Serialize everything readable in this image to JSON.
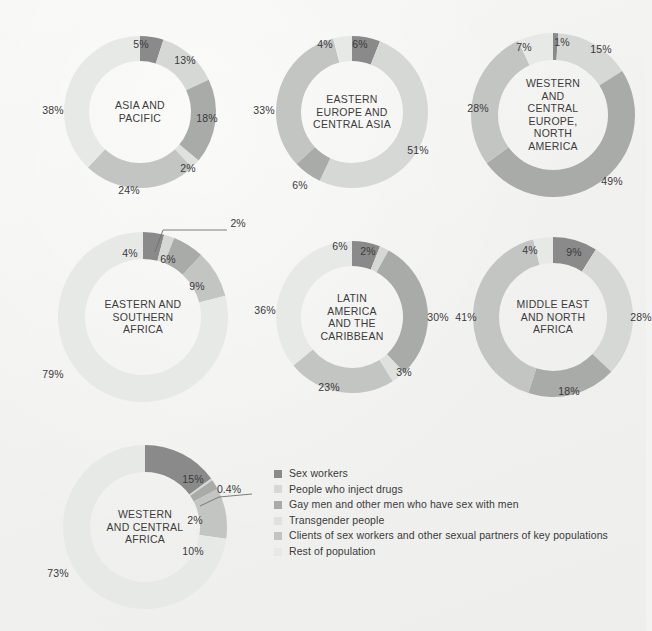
{
  "figure": {
    "background_color": "#f3f3f1",
    "label_color": "#3a3a3a"
  },
  "palette": {
    "sex_workers": "#8a8a8a",
    "people_who_inject_drugs": "#d6d8d6",
    "gay_men": "#a9aba9",
    "transgender_people": "#dfe1df",
    "clients_and_partners": "#c3c5c3",
    "rest_of_population": "#e7e9e7"
  },
  "legend": {
    "position": "bottom-right",
    "items": [
      {
        "label": "Sex workers",
        "color": "#8a8a8a"
      },
      {
        "label": "People who inject drugs",
        "color": "#d6d8d6"
      },
      {
        "label": "Gay men and other men who have sex with men",
        "color": "#a9aba9"
      },
      {
        "label": "Transgender people",
        "color": "#dfe1df"
      },
      {
        "label": "Clients of sex workers and other sexual partners of key populations",
        "color": "#c3c5c3"
      },
      {
        "label": "Rest of population",
        "color": "#e7e9e7"
      }
    ]
  },
  "chart_data": {
    "type": "pie",
    "title": "",
    "subtype": "donut-small-multiples",
    "grid": false,
    "legend_position": "bottom-right",
    "categories": [
      "Sex workers",
      "People who inject drugs",
      "Gay men and other men who have sex with men",
      "Transgender people",
      "Clients of sex workers and other sexual partners of key populations",
      "Rest of population"
    ],
    "category_colors": [
      "#8a8a8a",
      "#d6d8d6",
      "#a9aba9",
      "#dfe1df",
      "#c3c5c3",
      "#e7e9e7"
    ],
    "start_angle_deg": 0,
    "direction": "clockwise",
    "charts": [
      {
        "id": "asia-and-pacific",
        "title_lines": [
          "ASIA AND",
          "PACIFIC"
        ],
        "values": [
          5,
          13,
          18,
          2,
          24,
          38
        ],
        "labels": [
          "5%",
          "13%",
          "18%",
          "2%",
          "24%",
          "38%"
        ],
        "callouts": []
      },
      {
        "id": "eastern-europe-and-central-asia",
        "title_lines": [
          "EASTERN",
          "EUROPE AND",
          "CENTRAL ASIA"
        ],
        "values": [
          6,
          51,
          6,
          33,
          4
        ],
        "labels": [
          "6%",
          "51%",
          "6%",
          "33%",
          "4%"
        ],
        "value_categories": [
          "Sex workers",
          "People who inject drugs",
          "Gay men and other men who have sex with men",
          "Clients of sex workers and other sexual partners of key populations",
          "Rest of population"
        ],
        "callouts": []
      },
      {
        "id": "western-and-central-europe-north-america",
        "title_lines": [
          "WESTERN",
          "AND",
          "CENTRAL",
          "EUROPE,",
          "NORTH",
          "AMERICA"
        ],
        "values": [
          1,
          15,
          49,
          28,
          7
        ],
        "labels": [
          "1%",
          "15%",
          "49%",
          "28%",
          "7%"
        ],
        "value_categories": [
          "Sex workers",
          "People who inject drugs",
          "Gay men and other men who have sex with men",
          "Clients of sex workers and other sexual partners of key populations",
          "Rest of population"
        ],
        "callouts": []
      },
      {
        "id": "eastern-and-southern-africa",
        "title_lines": [
          "EASTERN AND",
          "SOUTHERN",
          "AFRICA"
        ],
        "values": [
          4,
          2,
          6,
          9,
          79
        ],
        "labels": [
          "4%",
          "2%",
          "6%",
          "9%",
          "79%"
        ],
        "value_categories": [
          "Sex workers",
          "People who inject drugs",
          "Gay men and other men who have sex with men",
          "Clients of sex workers and other sexual partners of key populations",
          "Rest of population"
        ],
        "callouts": [
          {
            "label": "2%",
            "value": 2
          }
        ]
      },
      {
        "id": "latin-america-and-the-caribbean",
        "title_lines": [
          "LATIN",
          "AMERICA",
          "AND THE",
          "CARIBBEAN"
        ],
        "values": [
          6,
          2,
          30,
          3,
          23,
          36
        ],
        "labels": [
          "6%",
          "2%",
          "30%",
          "3%",
          "23%",
          "36%"
        ],
        "callouts": []
      },
      {
        "id": "middle-east-and-north-africa",
        "title_lines": [
          "MIDDLE EAST",
          "AND NORTH",
          "AFRICA"
        ],
        "values": [
          9,
          28,
          18,
          41,
          4
        ],
        "labels": [
          "9%",
          "28%",
          "18%",
          "41%",
          "4%"
        ],
        "value_categories": [
          "Sex workers",
          "People who inject drugs",
          "Gay men and other men who have sex with men",
          "Clients of sex workers and other sexual partners of key populations",
          "Rest of population"
        ],
        "callouts": []
      },
      {
        "id": "western-and-central-africa",
        "title_lines": [
          "WESTERN",
          "AND CENTRAL",
          "AFRICA"
        ],
        "values": [
          15,
          0.4,
          2,
          10,
          73
        ],
        "labels": [
          "15%",
          "0.4%",
          "2%",
          "10%",
          "73%"
        ],
        "value_categories": [
          "Sex workers",
          "People who inject drugs",
          "Gay men and other men who have sex with men",
          "Clients of sex workers and other sexual partners of key populations",
          "Rest of population"
        ],
        "callouts": [
          {
            "label": "0.4%",
            "value": 0.4
          }
        ]
      }
    ]
  },
  "layout": {
    "panels": [
      {
        "id": "asia-and-pacific",
        "cx": 140,
        "cy": 112,
        "r": 76,
        "thickness": 25,
        "title_font": 10.5
      },
      {
        "id": "eastern-europe-and-central-asia",
        "cx": 352,
        "cy": 112,
        "r": 76,
        "thickness": 25,
        "title_font": 10.5
      },
      {
        "id": "western-and-central-europe-north-america",
        "cx": 553,
        "cy": 115,
        "r": 82,
        "thickness": 27,
        "title_font": 10.5
      },
      {
        "id": "eastern-and-southern-africa",
        "cx": 143,
        "cy": 317,
        "r": 85,
        "thickness": 27,
        "title_font": 10.5
      },
      {
        "id": "latin-america-and-the-caribbean",
        "cx": 352,
        "cy": 317,
        "r": 76,
        "thickness": 25,
        "title_font": 10.5
      },
      {
        "id": "middle-east-and-north-africa",
        "cx": 553,
        "cy": 317,
        "r": 80,
        "thickness": 26,
        "title_font": 10.5
      },
      {
        "id": "western-and-central-africa",
        "cx": 145,
        "cy": 527,
        "r": 82,
        "thickness": 27,
        "title_font": 10.5
      }
    ],
    "slice_labels": {
      "asia-and-pacific": [
        {
          "text": "5%",
          "x": 141,
          "y": 44
        },
        {
          "text": "13%",
          "x": 185,
          "y": 60
        },
        {
          "text": "18%",
          "x": 207,
          "y": 118
        },
        {
          "text": "2%",
          "x": 188,
          "y": 168
        },
        {
          "text": "24%",
          "x": 129,
          "y": 190
        },
        {
          "text": "38%",
          "x": 53,
          "y": 110
        }
      ],
      "eastern-europe-and-central-asia": [
        {
          "text": "6%",
          "x": 360,
          "y": 44
        },
        {
          "text": "51%",
          "x": 418,
          "y": 150
        },
        {
          "text": "6%",
          "x": 300,
          "y": 185
        },
        {
          "text": "33%",
          "x": 264,
          "y": 110
        },
        {
          "text": "4%",
          "x": 325,
          "y": 44
        }
      ],
      "western-and-central-europe-north-america": [
        {
          "text": "1%",
          "x": 562,
          "y": 42
        },
        {
          "text": "15%",
          "x": 601,
          "y": 49
        },
        {
          "text": "49%",
          "x": 612,
          "y": 181
        },
        {
          "text": "28%",
          "x": 478,
          "y": 108
        },
        {
          "text": "7%",
          "x": 524,
          "y": 47
        }
      ],
      "eastern-and-southern-africa": [
        {
          "text": "4%",
          "x": 130,
          "y": 253
        },
        {
          "text": "6%",
          "x": 168,
          "y": 259
        },
        {
          "text": "9%",
          "x": 197,
          "y": 286
        },
        {
          "text": "79%",
          "x": 53,
          "y": 374
        }
      ],
      "latin-america-and-the-caribbean": [
        {
          "text": "6%",
          "x": 340,
          "y": 246
        },
        {
          "text": "2%",
          "x": 368,
          "y": 251
        },
        {
          "text": "30%",
          "x": 438,
          "y": 317
        },
        {
          "text": "3%",
          "x": 404,
          "y": 372
        },
        {
          "text": "23%",
          "x": 329,
          "y": 387
        },
        {
          "text": "36%",
          "x": 265,
          "y": 310
        }
      ],
      "middle-east-and-north-africa": [
        {
          "text": "9%",
          "x": 574,
          "y": 252
        },
        {
          "text": "28%",
          "x": 641,
          "y": 317
        },
        {
          "text": "18%",
          "x": 569,
          "y": 391
        },
        {
          "text": "41%",
          "x": 466,
          "y": 317
        },
        {
          "text": "4%",
          "x": 530,
          "y": 250
        }
      ],
      "western-and-central-africa": [
        {
          "text": "15%",
          "x": 193,
          "y": 479
        },
        {
          "text": "2%",
          "x": 195,
          "y": 520
        },
        {
          "text": "10%",
          "x": 193,
          "y": 551
        },
        {
          "text": "73%",
          "x": 58,
          "y": 573
        }
      ]
    },
    "callout_labels": [
      {
        "chart": "eastern-and-southern-africa",
        "text": "2%",
        "x": 238,
        "y": 223
      },
      {
        "chart": "western-and-central-africa",
        "text": "0.4%",
        "x": 229,
        "y": 489
      }
    ]
  }
}
